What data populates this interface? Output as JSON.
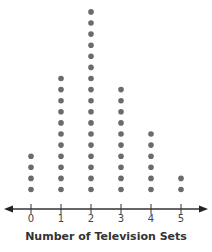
{
  "chart_data": {
    "type": "dot_plot",
    "title": "",
    "xlabel": "Number of Television Sets",
    "ylabel": "",
    "categories": [
      "0",
      "1",
      "2",
      "3",
      "4",
      "5"
    ],
    "values": [
      4,
      11,
      17,
      10,
      6,
      2
    ],
    "x_range": [
      0,
      5
    ],
    "grid": false,
    "legend": null,
    "axis": {
      "arrows": "both",
      "tick_labels": [
        "0",
        "1",
        "2",
        "3",
        "4",
        "5"
      ]
    },
    "colors": {
      "dot": "#6b6b6b",
      "axis": "#333333",
      "label": "#333333"
    }
  },
  "xlabel": "Number of Television Sets",
  "ticks": [
    "0",
    "1",
    "2",
    "3",
    "4",
    "5"
  ]
}
